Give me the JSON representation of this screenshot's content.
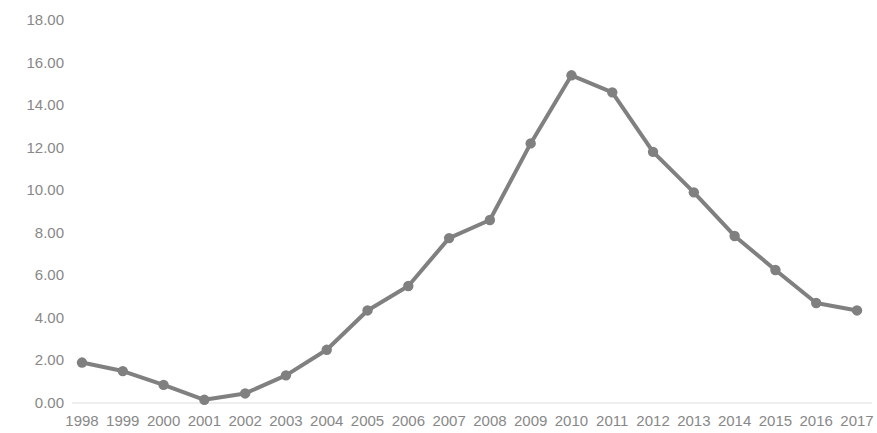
{
  "chart_data": {
    "type": "line",
    "title": "",
    "subtitle": "",
    "xlabel": "",
    "ylabel": "",
    "categories": [
      "1998",
      "1999",
      "2000",
      "2001",
      "2002",
      "2003",
      "2004",
      "2005",
      "2006",
      "2007",
      "2008",
      "2009",
      "2010",
      "2011",
      "2012",
      "2013",
      "2014",
      "2015",
      "2016",
      "2017"
    ],
    "values": [
      1.9,
      1.5,
      0.85,
      0.15,
      0.45,
      1.3,
      2.5,
      4.35,
      5.5,
      7.75,
      8.6,
      12.2,
      15.4,
      14.6,
      11.8,
      9.9,
      7.85,
      6.25,
      4.7,
      4.35
    ],
    "series": [
      {
        "name": "",
        "values": [
          1.9,
          1.5,
          0.85,
          0.15,
          0.45,
          1.3,
          2.5,
          4.35,
          5.5,
          7.75,
          8.6,
          12.2,
          15.4,
          14.6,
          11.8,
          9.9,
          7.85,
          6.25,
          4.7,
          4.35
        ]
      }
    ],
    "ytick_labels": [
      "18.00",
      "16.00",
      "14.00",
      "12.00",
      "10.00",
      "8.00",
      "6.00",
      "4.00",
      "2.00",
      "0.00"
    ],
    "ytick_values": [
      18,
      16,
      14,
      12,
      10,
      8,
      6,
      4,
      2,
      0
    ],
    "ylim": [
      0,
      18
    ],
    "grid": false,
    "baseline_gridline": true,
    "legend": "none",
    "markers": "circle",
    "line_color": "#808080",
    "marker_color": "#808080",
    "axis_label_color": "#888888",
    "baseline_color": "#e8e8e8",
    "background_color": "#ffffff"
  }
}
